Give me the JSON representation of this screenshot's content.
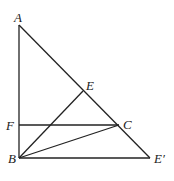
{
  "diagram": {
    "type": "geometry",
    "points": [
      {
        "id": "A",
        "label": "A"
      },
      {
        "id": "B",
        "label": "B"
      },
      {
        "id": "C",
        "label": "C"
      },
      {
        "id": "E",
        "label": "E"
      },
      {
        "id": "F",
        "label": "F"
      },
      {
        "id": "Ep",
        "label": "E′"
      }
    ],
    "segments": [
      [
        "A",
        "B"
      ],
      [
        "A",
        "Ep"
      ],
      [
        "B",
        "Ep"
      ],
      [
        "F",
        "C"
      ],
      [
        "B",
        "E"
      ],
      [
        "B",
        "C"
      ]
    ]
  }
}
